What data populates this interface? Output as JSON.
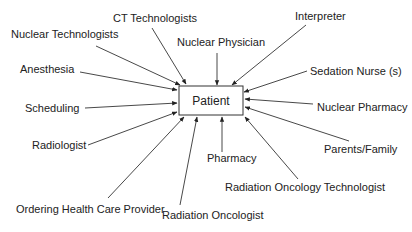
{
  "diagram": {
    "type": "hub-and-spoke",
    "center": {
      "label": "Patient",
      "x": 179,
      "y": 86,
      "w": 64,
      "h": 29
    },
    "nodes": [
      {
        "id": "ct-technologists",
        "label": "CT Technologists",
        "tx": 113,
        "ty": 22,
        "x1": 152,
        "y1": 28,
        "x2": 186,
        "y2": 84
      },
      {
        "id": "nuclear-technologists",
        "label": "Nuclear Technologists",
        "tx": 11,
        "ty": 38,
        "x1": 96,
        "y1": 46,
        "x2": 180,
        "y2": 85
      },
      {
        "id": "nuclear-physician",
        "label": "Nuclear Physician",
        "tx": 177,
        "ty": 46,
        "x1": 217,
        "y1": 53,
        "x2": 217,
        "y2": 85
      },
      {
        "id": "interpreter",
        "label": "Interpreter",
        "tx": 295,
        "ty": 20,
        "x1": 306,
        "y1": 25,
        "x2": 232,
        "y2": 85
      },
      {
        "id": "sedation-nurse",
        "label": "Sedation Nurse (s)",
        "tx": 310,
        "ty": 75,
        "x1": 307,
        "y1": 71,
        "x2": 244,
        "y2": 92
      },
      {
        "id": "anesthesia",
        "label": "Anesthesia",
        "tx": 20,
        "ty": 73,
        "x1": 80,
        "y1": 72,
        "x2": 177,
        "y2": 90
      },
      {
        "id": "scheduling",
        "label": "Scheduling",
        "tx": 25,
        "ty": 112,
        "x1": 85,
        "y1": 108,
        "x2": 177,
        "y2": 103
      },
      {
        "id": "nuclear-pharmacy",
        "label": "Nuclear Pharmacy",
        "tx": 317,
        "ty": 111,
        "x1": 313,
        "y1": 104,
        "x2": 245,
        "y2": 99
      },
      {
        "id": "radiologist",
        "label": "Radiologist",
        "tx": 32,
        "ty": 149,
        "x1": 88,
        "y1": 145,
        "x2": 177,
        "y2": 112
      },
      {
        "id": "parents-family",
        "label": "Parents/Family",
        "tx": 324,
        "ty": 153,
        "x1": 349,
        "y1": 141,
        "x2": 245,
        "y2": 107
      },
      {
        "id": "pharmacy",
        "label": "Pharmacy",
        "tx": 207,
        "ty": 162,
        "x1": 222,
        "y1": 152,
        "x2": 222,
        "y2": 117
      },
      {
        "id": "radiation-oncology-technologist",
        "label": "Radiation Oncology Technologist",
        "tx": 225,
        "ty": 191,
        "x1": 298,
        "y1": 179,
        "x2": 245,
        "y2": 117
      },
      {
        "id": "ordering-health-care-provider",
        "label": "Ordering Health Care Provider",
        "tx": 16,
        "ty": 213,
        "x1": 108,
        "y1": 198,
        "x2": 184,
        "y2": 117
      },
      {
        "id": "radiation-oncologist",
        "label": "Radiation Oncologist",
        "tx": 162,
        "ty": 219,
        "x1": 180,
        "y1": 205,
        "x2": 197,
        "y2": 117
      }
    ]
  }
}
